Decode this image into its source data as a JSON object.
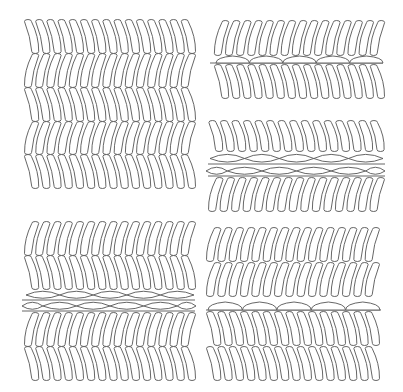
{
  "colors": {
    "stroke": "#555555",
    "background": "#ffffff"
  },
  "panels": [
    {
      "name": "panel-top-left",
      "rows": [
        {
          "x0": 26,
          "x1": 194,
          "y0": 20,
          "y1": 53,
          "tilt": "left",
          "count": 15
        },
        {
          "x0": 26,
          "x1": 194,
          "y0": 54,
          "y1": 87,
          "tilt": "right",
          "count": 15
        },
        {
          "x0": 26,
          "x1": 194,
          "y0": 88,
          "y1": 121,
          "tilt": "left",
          "count": 15
        },
        {
          "x0": 26,
          "x1": 194,
          "y0": 122,
          "y1": 154,
          "tilt": "right",
          "count": 15
        },
        {
          "x0": 26,
          "x1": 194,
          "y0": 155,
          "y1": 188,
          "tilt": "left",
          "count": 15
        }
      ],
      "lens_layers": [],
      "lines": []
    },
    {
      "name": "panel-top-right",
      "rows": [
        {
          "x0": 216,
          "x1": 383,
          "y0": 21,
          "y1": 55,
          "tilt": "right",
          "count": 15
        },
        {
          "x0": 216,
          "x1": 383,
          "y0": 65,
          "y1": 98,
          "tilt": "left",
          "count": 15
        }
      ],
      "lens_layers": [
        {
          "x0": 216,
          "x1": 383,
          "y": 63,
          "h": 7,
          "count": 5,
          "shape": "dome"
        }
      ],
      "lines": [
        {
          "x0": 210,
          "x1": 383,
          "y": 63
        }
      ]
    },
    {
      "name": "panel-middle-right",
      "rows": [
        {
          "x0": 210,
          "x1": 383,
          "y0": 121,
          "y1": 151,
          "tilt": "left",
          "count": 15
        },
        {
          "x0": 210,
          "x1": 383,
          "y0": 178,
          "y1": 211,
          "tilt": "right",
          "count": 15
        }
      ],
      "lens_layers": [
        {
          "x0": 210,
          "x1": 383,
          "y": 164,
          "h": 11,
          "count": 5,
          "shape": "lens",
          "offset": 0
        },
        {
          "x0": 210,
          "x1": 383,
          "y": 176,
          "h": 10,
          "count": 5,
          "shape": "lens",
          "offset": 0.5
        }
      ],
      "lines": [
        {
          "x0": 208,
          "x1": 385,
          "y": 164
        },
        {
          "x0": 208,
          "x1": 385,
          "y": 176
        }
      ]
    },
    {
      "name": "panel-bottom-left",
      "rows": [
        {
          "x0": 26,
          "x1": 194,
          "y0": 222,
          "y1": 255,
          "tilt": "right",
          "count": 15
        },
        {
          "x0": 26,
          "x1": 194,
          "y0": 256,
          "y1": 289,
          "tilt": "left",
          "count": 15
        },
        {
          "x0": 26,
          "x1": 194,
          "y0": 313,
          "y1": 346,
          "tilt": "right",
          "count": 15
        },
        {
          "x0": 26,
          "x1": 194,
          "y0": 347,
          "y1": 380,
          "tilt": "left",
          "count": 15
        }
      ],
      "lens_layers": [
        {
          "x0": 26,
          "x1": 194,
          "y": 300,
          "h": 10,
          "count": 5,
          "shape": "lens",
          "offset": 0
        },
        {
          "x0": 26,
          "x1": 194,
          "y": 311,
          "h": 10,
          "count": 5,
          "shape": "lens",
          "offset": 0.5
        }
      ],
      "lines": [
        {
          "x0": 22,
          "x1": 195,
          "y": 300
        },
        {
          "x0": 22,
          "x1": 195,
          "y": 311
        }
      ]
    },
    {
      "name": "panel-bottom-right",
      "rows": [
        {
          "x0": 208,
          "x1": 378,
          "y0": 228,
          "y1": 261,
          "tilt": "right",
          "count": 15
        },
        {
          "x0": 208,
          "x1": 378,
          "y0": 263,
          "y1": 296,
          "tilt": "right",
          "count": 15
        },
        {
          "x0": 208,
          "x1": 378,
          "y0": 312,
          "y1": 345,
          "tilt": "left",
          "count": 15
        },
        {
          "x0": 208,
          "x1": 378,
          "y0": 347,
          "y1": 380,
          "tilt": "left",
          "count": 15
        }
      ],
      "lens_layers": [
        {
          "x0": 208,
          "x1": 380,
          "y": 310,
          "h": 8,
          "count": 5,
          "shape": "dome"
        }
      ],
      "lines": [
        {
          "x0": 206,
          "x1": 381,
          "y": 310
        }
      ]
    }
  ]
}
